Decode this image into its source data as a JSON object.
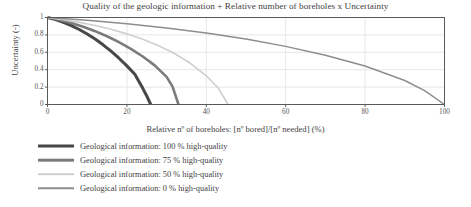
{
  "chart_data": {
    "type": "line",
    "title": "Quality of the geologic information + Relative number of boreholes x Uncertainty",
    "xlabel": "Relative nº of boreholes: [nº bored]/[nº needed] (%)",
    "ylabel": "Uncertainty (-)",
    "xlim": [
      0,
      100
    ],
    "ylim": [
      0,
      1
    ],
    "xticks": [
      "0",
      "20",
      "40",
      "60",
      "80",
      "100"
    ],
    "xtick_values": [
      0,
      20,
      40,
      60,
      80,
      100
    ],
    "yticks": [
      "0",
      "0.2",
      "0.4",
      "0.6",
      "0.8",
      "1"
    ],
    "ytick_values": [
      0,
      0.2,
      0.4,
      0.6,
      0.8,
      1
    ],
    "grid": "horizontal-and-vertical-light",
    "legend_position": "below-plot-left",
    "series": [
      {
        "name": "Geological information: 100 % high-quality",
        "color": "#474747",
        "width": 3.0,
        "x_end": 26,
        "points": [
          [
            0,
            1.0
          ],
          [
            2,
            0.975
          ],
          [
            4,
            0.944
          ],
          [
            6,
            0.906
          ],
          [
            8,
            0.862
          ],
          [
            10,
            0.81
          ],
          [
            12,
            0.752
          ],
          [
            14,
            0.686
          ],
          [
            16,
            0.613
          ],
          [
            18,
            0.532
          ],
          [
            20,
            0.444
          ],
          [
            22,
            0.348
          ],
          [
            24,
            0.186
          ],
          [
            25,
            0.098
          ],
          [
            26,
            0.0
          ]
        ]
      },
      {
        "name": "Geological information: 75 % high-quality",
        "color": "#7b7b7b",
        "width": 2.6,
        "x_end": 33,
        "points": [
          [
            0,
            1.0
          ],
          [
            3,
            0.972
          ],
          [
            6,
            0.936
          ],
          [
            9,
            0.893
          ],
          [
            12,
            0.843
          ],
          [
            15,
            0.784
          ],
          [
            18,
            0.717
          ],
          [
            21,
            0.64
          ],
          [
            24,
            0.552
          ],
          [
            27,
            0.45
          ],
          [
            30,
            0.318
          ],
          [
            31.5,
            0.206
          ],
          [
            33,
            0.0
          ]
        ]
      },
      {
        "name": "Geological information: 50 % high-quality",
        "color": "#cfcfcf",
        "width": 1.6,
        "x_end": 45.5,
        "points": [
          [
            0,
            1.0
          ],
          [
            4,
            0.975
          ],
          [
            8,
            0.944
          ],
          [
            12,
            0.907
          ],
          [
            16,
            0.864
          ],
          [
            20,
            0.812
          ],
          [
            24,
            0.75
          ],
          [
            28,
            0.676
          ],
          [
            32,
            0.586
          ],
          [
            36,
            0.474
          ],
          [
            40,
            0.33
          ],
          [
            43,
            0.19
          ],
          [
            45.5,
            0.0
          ]
        ]
      },
      {
        "name": "Geological information: 0 % high-quality",
        "color": "#8d8d8d",
        "width": 1.5,
        "x_end": 100,
        "points": [
          [
            0,
            1.0
          ],
          [
            10,
            0.968
          ],
          [
            20,
            0.928
          ],
          [
            30,
            0.88
          ],
          [
            40,
            0.822
          ],
          [
            50,
            0.752
          ],
          [
            60,
            0.668
          ],
          [
            70,
            0.566
          ],
          [
            80,
            0.442
          ],
          [
            90,
            0.276
          ],
          [
            95,
            0.16
          ],
          [
            100,
            0.0
          ]
        ]
      }
    ]
  },
  "plot": {
    "frame_color": "#595959",
    "grid_color": "#e6e6e6",
    "background": "#ffffff"
  }
}
